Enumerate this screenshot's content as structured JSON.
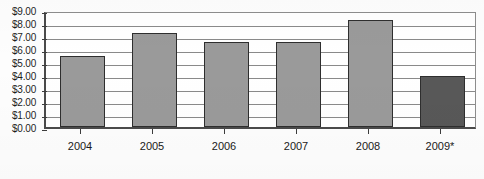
{
  "chart_data": {
    "type": "bar",
    "title": "",
    "xlabel": "",
    "ylabel": "",
    "categories": [
      "2004",
      "2005",
      "2006",
      "2007",
      "2008",
      "2009*"
    ],
    "values": [
      5.45,
      7.25,
      6.55,
      6.55,
      8.2,
      3.95
    ],
    "ylim": [
      0,
      9
    ],
    "ytick_step": 1,
    "ytick_labels": [
      "$9.00",
      "$8.00",
      "$7.00",
      "$6.00",
      "$5.00",
      "$4.00",
      "$3.00",
      "$2.00",
      "$1.00",
      "$0.00"
    ],
    "ytick_values": [
      9,
      8,
      7,
      6,
      5,
      4,
      3,
      2,
      1,
      0
    ],
    "grid": true,
    "legend": false,
    "series": [
      {
        "name": "Value",
        "values": [
          5.45,
          7.25,
          6.55,
          6.55,
          8.2,
          3.95
        ]
      }
    ],
    "bar_colors": [
      "#9a9a9a",
      "#9a9a9a",
      "#9a9a9a",
      "#9a9a9a",
      "#9a9a9a",
      "#585858"
    ],
    "highlight_category": "2009*",
    "annotations": [
      "* denotes projected/estimated value"
    ]
  },
  "colors": {
    "bar_fill": "#9a9a9a",
    "bar_fill_highlight": "#585858",
    "bar_border": "#2e2e2e",
    "gridline": "#8a8a8a",
    "axis": "#4a4a4a",
    "text": "#1a1a1a",
    "background": "#ffffff"
  }
}
